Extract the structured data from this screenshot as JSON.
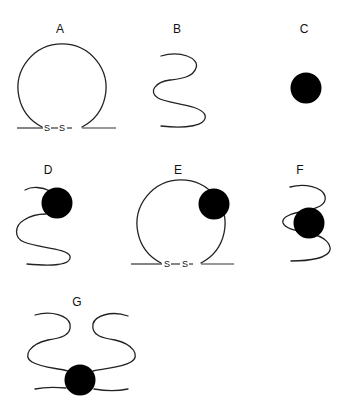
{
  "diagram": {
    "panels": [
      {
        "id": "A",
        "label": "A",
        "shape": "disulfide-loop",
        "bond_text": [
          "S",
          "S"
        ]
      },
      {
        "id": "B",
        "label": "B",
        "shape": "linear-wavy-chain"
      },
      {
        "id": "C",
        "label": "C",
        "shape": "solid-sphere"
      },
      {
        "id": "D",
        "label": "D",
        "shape": "wavy-chain-with-sphere"
      },
      {
        "id": "E",
        "label": "E",
        "shape": "disulfide-loop-with-sphere",
        "bond_text": [
          "S",
          "S"
        ]
      },
      {
        "id": "F",
        "label": "F",
        "shape": "chain-wrapped-around-sphere"
      },
      {
        "id": "G",
        "label": "G",
        "shape": "two-chains-bound-to-sphere"
      }
    ],
    "colors": {
      "line": "#222222",
      "sphere": "#000000",
      "background": "#ffffff"
    }
  }
}
